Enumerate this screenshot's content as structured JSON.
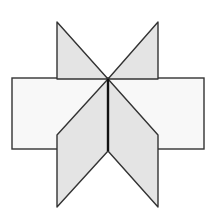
{
  "figure": {
    "colors": {
      "background": "#ffffff",
      "rectangle_fill": "#f8f8f8",
      "panel_fill": "#e4e4e4",
      "stroke": "#333333",
      "spine": "#111111"
    },
    "rectangle": {
      "x": 12,
      "y": 78,
      "width": 192,
      "height": 71
    },
    "center_vertex": {
      "x": 108,
      "y": 79
    },
    "spine_bottom": {
      "x": 108,
      "y": 151
    },
    "panels": [
      {
        "name": "top-left-triangle",
        "points": "57,22 108,79 57,79"
      },
      {
        "name": "top-right-triangle",
        "points": "158,22 158,79 108,79"
      },
      {
        "name": "bottom-left-parallelogram",
        "points": "108,79 108,151 57,207 57,135"
      },
      {
        "name": "bottom-right-parallelogram",
        "points": "108,79 158,135 158,207 108,151"
      }
    ]
  }
}
